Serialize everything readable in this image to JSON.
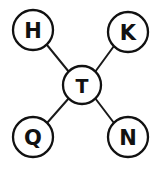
{
  "diagram": {
    "type": "node-link-star",
    "background_color": "#ffffff",
    "stroke_color": "#111111",
    "edge_color": "#1a1a1a",
    "canvas": {
      "width": 163,
      "height": 169
    },
    "center_node": {
      "id": "T",
      "label": "T",
      "cx": 82,
      "cy": 85,
      "r": 19
    },
    "outer_nodes": [
      {
        "id": "H",
        "label": "H",
        "cx": 33,
        "cy": 30,
        "r": 20,
        "position": "top-left"
      },
      {
        "id": "K",
        "label": "K",
        "cx": 128,
        "cy": 32,
        "r": 20,
        "position": "top-right"
      },
      {
        "id": "Q",
        "label": "Q",
        "cx": 33,
        "cy": 137,
        "r": 20,
        "position": "bottom-left"
      },
      {
        "id": "N",
        "label": "N",
        "cx": 128,
        "cy": 137,
        "r": 20,
        "position": "bottom-right"
      }
    ],
    "edges": [
      {
        "id": "edge-h-t",
        "from": "H",
        "to": "T",
        "x1": 47,
        "y1": 45,
        "x2": 69,
        "y2": 72
      },
      {
        "id": "edge-k-t",
        "from": "K",
        "to": "T",
        "x1": 114,
        "y1": 46,
        "x2": 95,
        "y2": 72
      },
      {
        "id": "edge-q-t",
        "from": "Q",
        "to": "T",
        "x1": 47,
        "y1": 123,
        "x2": 69,
        "y2": 98
      },
      {
        "id": "edge-n-t",
        "from": "N",
        "to": "T",
        "x1": 114,
        "y1": 123,
        "x2": 95,
        "y2": 98
      }
    ]
  }
}
